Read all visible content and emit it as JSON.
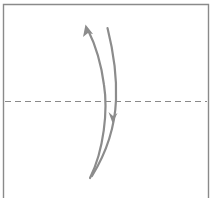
{
  "diagram": {
    "type": "origami-fold-step",
    "colors": {
      "background": "#ffffff",
      "paper_border": "#8a8a8a",
      "fold_line": "#8a8a8a",
      "arrows": "#8c8c8c"
    },
    "elements": {
      "paper": {
        "label": "square-paper"
      },
      "fold_line": {
        "style": "dashed",
        "orientation": "horizontal",
        "kind": "valley-fold"
      },
      "arrows": [
        {
          "name": "fold-up-arrow",
          "direction": "up"
        },
        {
          "name": "fold-down-arrow",
          "direction": "down"
        }
      ]
    }
  }
}
